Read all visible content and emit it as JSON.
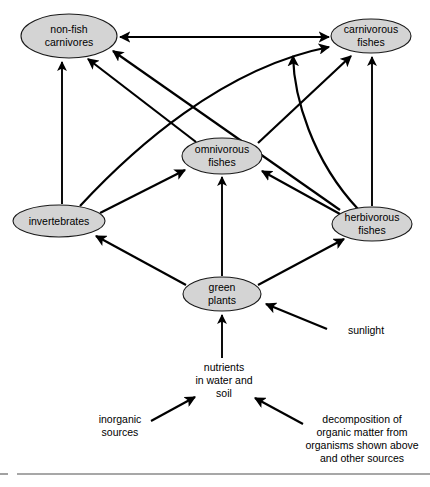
{
  "diagram": {
    "colors": {
      "node_fill": "#d4d4d4",
      "node_stroke": "#1a1a1a",
      "arrow": "#000000",
      "rule": "#8a8a8a",
      "background": "#ffffff"
    },
    "nodes": [
      {
        "id": "non_fish_carnivores",
        "line1": "non-fish",
        "line2": "carnivores",
        "cx": 69,
        "cy": 36,
        "rx": 48,
        "ry": 22
      },
      {
        "id": "carnivorous_fishes",
        "line1": "carnivorous",
        "line2": "fishes",
        "cx": 371,
        "cy": 36,
        "rx": 40,
        "ry": 17
      },
      {
        "id": "omnivorous_fishes",
        "line1": "omnivorous",
        "line2": "fishes",
        "cx": 222,
        "cy": 156,
        "rx": 40,
        "ry": 18
      },
      {
        "id": "invertebrates",
        "line1": "invertebrates",
        "line2": "",
        "cx": 59,
        "cy": 221,
        "rx": 46,
        "ry": 16
      },
      {
        "id": "herbivorous_fishes",
        "line1": "herbivorous",
        "line2": "fishes",
        "cx": 372,
        "cy": 224,
        "rx": 40,
        "ry": 17
      },
      {
        "id": "green_plants",
        "line1": "green",
        "line2": "plants",
        "cx": 222,
        "cy": 294,
        "rx": 39,
        "ry": 17
      }
    ],
    "free_labels": [
      {
        "id": "sunlight",
        "lines": [
          "sunlight"
        ],
        "x": 366,
        "y": 331
      },
      {
        "id": "nutrients",
        "lines": [
          "nutrients",
          "in water and",
          "soil"
        ],
        "x": 224,
        "y": 371
      },
      {
        "id": "inorganic_sources",
        "lines": [
          "inorganic",
          "sources"
        ],
        "x": 120,
        "y": 423
      },
      {
        "id": "decomposition",
        "lines": [
          "decomposition of",
          "organic matter from",
          "organisms shown above",
          "and other sources"
        ],
        "x": 362,
        "y": 420
      }
    ],
    "edges": [
      {
        "id": "edge-invertebrates-to-non-fish-carnivores",
        "from": "invertebrates",
        "to": "non_fish_carnivores",
        "style": "straight",
        "arrows": "end"
      },
      {
        "id": "edge-invertebrates-to-carnivorous-fishes",
        "from": "invertebrates",
        "to": "carnivorous_fishes",
        "style": "curved",
        "arrows": "end"
      },
      {
        "id": "edge-invertebrates-to-omnivorous-fishes",
        "from": "invertebrates",
        "to": "omnivorous_fishes",
        "style": "straight",
        "arrows": "end"
      },
      {
        "id": "edge-omnivorous-fishes-to-non-fish-carnivores",
        "from": "omnivorous_fishes",
        "to": "non_fish_carnivores",
        "style": "straight",
        "arrows": "end"
      },
      {
        "id": "edge-omnivorous-fishes-to-carnivorous-fishes",
        "from": "omnivorous_fishes",
        "to": "carnivorous_fishes",
        "style": "straight",
        "arrows": "end"
      },
      {
        "id": "edge-herbivorous-fishes-to-non-fish-carnivores",
        "from": "herbivorous_fishes",
        "to": "non_fish_carnivores",
        "style": "straight",
        "arrows": "end"
      },
      {
        "id": "edge-herbivorous-fishes-to-carnivorous-fishes",
        "from": "herbivorous_fishes",
        "to": "carnivorous_fishes",
        "style": "curved",
        "arrows": "end"
      },
      {
        "id": "edge-herbivorous-fishes-to-carnivorous-fishes-direct",
        "from": "herbivorous_fishes",
        "to": "carnivorous_fishes",
        "style": "straight",
        "arrows": "end"
      },
      {
        "id": "edge-herbivorous-fishes-to-omnivorous-fishes",
        "from": "herbivorous_fishes",
        "to": "omnivorous_fishes",
        "style": "straight",
        "arrows": "end"
      },
      {
        "id": "edge-green-plants-to-omnivorous-fishes",
        "from": "green_plants",
        "to": "omnivorous_fishes",
        "style": "straight",
        "arrows": "end"
      },
      {
        "id": "edge-green-plants-to-invertebrates",
        "from": "green_plants",
        "to": "invertebrates",
        "style": "straight",
        "arrows": "end"
      },
      {
        "id": "edge-green-plants-to-herbivorous-fishes",
        "from": "green_plants",
        "to": "herbivorous_fishes",
        "style": "straight",
        "arrows": "end"
      },
      {
        "id": "edge-non-fish-carnivores-to-carnivorous-fishes",
        "from": "non_fish_carnivores",
        "to": "carnivorous_fishes",
        "style": "straight",
        "arrows": "both"
      },
      {
        "id": "edge-sunlight-to-green-plants",
        "from": "sunlight",
        "to": "green_plants",
        "style": "straight",
        "arrows": "end"
      },
      {
        "id": "edge-nutrients-to-green-plants",
        "from": "nutrients",
        "to": "green_plants",
        "style": "straight",
        "arrows": "end"
      },
      {
        "id": "edge-inorganic-sources-to-nutrients",
        "from": "inorganic_sources",
        "to": "nutrients",
        "style": "straight",
        "arrows": "end"
      },
      {
        "id": "edge-decomposition-to-nutrients",
        "from": "decomposition",
        "to": "nutrients",
        "style": "straight",
        "arrows": "end"
      }
    ]
  }
}
